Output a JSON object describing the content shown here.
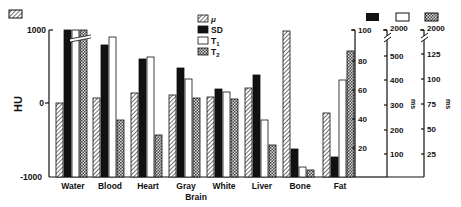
{
  "chart_data": {
    "type": "bar",
    "title": "",
    "xlabel": "",
    "ylabel": "HU",
    "categories": [
      "Water",
      "Blood",
      "Heart",
      "Gray",
      "White",
      "Liver",
      "Bone",
      "Fat"
    ],
    "category_sublabel": {
      "index": 3,
      "text": "Brain"
    },
    "series": [
      {
        "name": "μ",
        "key": "mu",
        "pattern": "hatch",
        "axis": "HU",
        "values": [
          0,
          70,
          140,
          110,
          80,
          200,
          1000,
          -300
        ]
      },
      {
        "name": "SD",
        "key": "sd",
        "pattern": "solid",
        "axis": "SD (%)",
        "values": [
          100,
          90,
          80,
          74,
          60,
          70,
          19,
          14
        ]
      },
      {
        "name": "T1",
        "key": "t1",
        "pattern": "open",
        "axis": "T1 ms",
        "values": [
          2000,
          480,
          440,
          340,
          310,
          200,
          35,
          380
        ]
      },
      {
        "name": "T2",
        "key": "t2",
        "pattern": "dots",
        "axis": "T2 ms",
        "values": [
          2000,
          110,
          62,
          90,
          80,
          57,
          5,
          86
        ]
      }
    ],
    "axes": {
      "left": {
        "label": "HU",
        "ticks": [
          "1000",
          "0",
          "-1000"
        ],
        "range": [
          -1000,
          1000
        ]
      },
      "right_sd": {
        "ticks": [
          "100",
          "80",
          "60",
          "40",
          "20"
        ],
        "range": [
          0,
          100
        ]
      },
      "right_t1": {
        "label": "ms",
        "ticks": [
          "2000",
          "500",
          "400",
          "300",
          "200",
          "100"
        ],
        "range": [
          0,
          550
        ],
        "break_top": "2000"
      },
      "right_t2": {
        "label": "ms",
        "ticks": [
          "2000",
          "125",
          "100",
          "75",
          "50",
          "25"
        ],
        "range": [
          0,
          140
        ],
        "break_top": "2000"
      }
    },
    "broken_bars": [
      "Water.SD",
      "Water.T1",
      "Water.T2"
    ],
    "legend": {
      "position": "top-center",
      "entries": [
        "μ",
        "SD",
        "T1",
        "T2"
      ]
    },
    "grid": false
  },
  "legend": {
    "mu": "μ",
    "sd": "SD",
    "t1": "T",
    "t1_sub": "1",
    "t2": "T",
    "t2_sub": "2"
  },
  "labels": {
    "y_axis": "HU",
    "ms1": "ms",
    "ms2": "ms",
    "brain": "Brain",
    "tick_1000": "1000",
    "tick_0": "0",
    "tick_m1000": "-1000"
  },
  "geometry_px": {
    "comment_none": "",
    "tops": {
      "Water": [
        103,
        30,
        30,
        30
      ],
      "Blood": [
        98,
        45,
        37,
        120
      ],
      "Heart": [
        93,
        59,
        57,
        135
      ],
      "Gray": [
        95,
        68,
        79,
        98
      ],
      "White": [
        97,
        89,
        92,
        99
      ],
      "Liver": [
        88,
        75,
        120,
        145
      ],
      "Bone": [
        31,
        149,
        167,
        170
      ],
      "Fat": [
        113,
        157,
        80,
        51
      ]
    }
  }
}
